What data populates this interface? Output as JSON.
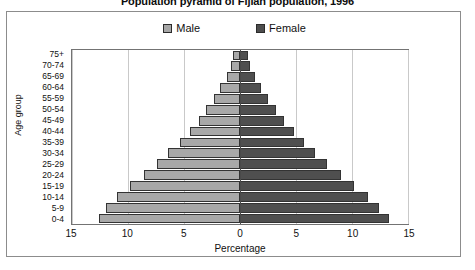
{
  "chart_title": "Population pyramid of Fijian population, 1996",
  "legend": {
    "position": "top-center",
    "entries": [
      {
        "label": "Male",
        "color": "#a8a8a8",
        "icon": "legend-swatch-male-icon"
      },
      {
        "label": "Female",
        "color": "#4f4f4f",
        "icon": "legend-swatch-female-icon"
      }
    ]
  },
  "axes": {
    "x_title": "Percentage",
    "y_title": "Age group",
    "x_tick_labels": [
      "15",
      "10",
      "5",
      "0",
      "5",
      "10",
      "15"
    ],
    "x_tick_values": [
      -15,
      -10,
      -5,
      0,
      5,
      10,
      15
    ],
    "x_limits": [
      -15,
      15
    ],
    "grid": "vertical"
  },
  "chart_data": {
    "type": "bar",
    "title": "Population pyramid of Fijian population, 1996",
    "xlabel": "Percentage",
    "ylabel": "Age group",
    "xlim": [
      -15,
      15
    ],
    "grid": true,
    "legend_position": "top-center",
    "orientation": "horizontal-diverging",
    "categories": [
      "75+",
      "70-74",
      "65-69",
      "60-64",
      "55-59",
      "50-54",
      "45-49",
      "40-44",
      "35-39",
      "30-34",
      "25-29",
      "20-24",
      "15-19",
      "10-14",
      "5-9",
      "0-4"
    ],
    "series": [
      {
        "name": "Male",
        "color": "#a8a8a8",
        "direction": "left",
        "values": [
          0.6,
          0.8,
          1.2,
          1.8,
          2.3,
          3.0,
          3.7,
          4.5,
          5.4,
          6.4,
          7.4,
          8.6,
          9.8,
          11.0,
          12.0,
          12.6
        ]
      },
      {
        "name": "Female",
        "color": "#4f4f4f",
        "direction": "right",
        "values": [
          0.7,
          0.9,
          1.3,
          1.9,
          2.5,
          3.2,
          3.9,
          4.8,
          5.7,
          6.7,
          7.8,
          9.0,
          10.2,
          11.4,
          12.4,
          13.3
        ]
      }
    ]
  }
}
